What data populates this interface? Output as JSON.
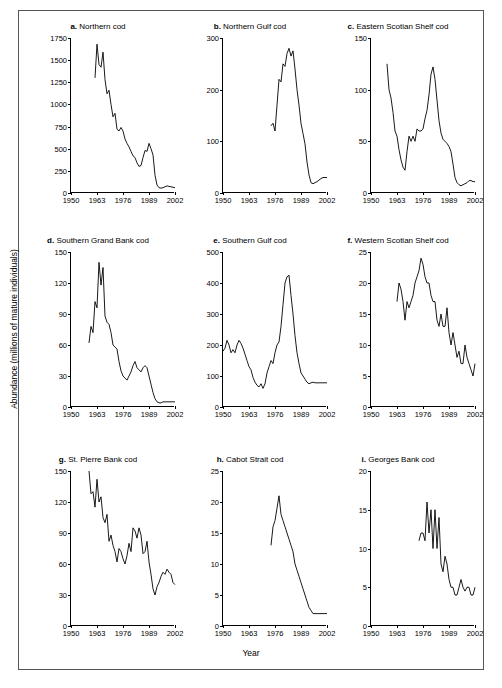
{
  "figure": {
    "ylabel": "Abundance (millions of mature individuals)",
    "xlabel": "Year"
  },
  "chart_data": [
    {
      "type": "line",
      "panel": "a",
      "title": "Northern cod",
      "xlabel": "",
      "ylabel": "",
      "grid": false,
      "legend": null,
      "xlim": [
        1950,
        2002
      ],
      "ylim": [
        0,
        1750
      ],
      "xticks": [
        1950,
        1963,
        1976,
        1989,
        2002
      ],
      "yticks": [
        0,
        250,
        500,
        750,
        1000,
        1250,
        1500,
        1750
      ],
      "x": [
        1962,
        1963,
        1964,
        1965,
        1966,
        1967,
        1968,
        1969,
        1970,
        1971,
        1972,
        1973,
        1974,
        1975,
        1976,
        1977,
        1978,
        1979,
        1980,
        1981,
        1982,
        1983,
        1984,
        1985,
        1986,
        1987,
        1988,
        1989,
        1990,
        1991,
        1992,
        1993,
        1994,
        1995,
        1996,
        1997,
        1998,
        1999,
        2000,
        2001,
        2002
      ],
      "values": [
        1300,
        1680,
        1450,
        1420,
        1590,
        1280,
        1120,
        1160,
        1000,
        860,
        900,
        720,
        700,
        740,
        700,
        610,
        560,
        520,
        470,
        420,
        400,
        340,
        300,
        310,
        400,
        480,
        470,
        560,
        500,
        430,
        200,
        90,
        60,
        55,
        60,
        70,
        80,
        75,
        70,
        65,
        60
      ]
    },
    {
      "type": "line",
      "panel": "b",
      "title": "Northern Gulf cod",
      "xlabel": "",
      "ylabel": "",
      "grid": false,
      "legend": null,
      "xlim": [
        1950,
        2002
      ],
      "ylim": [
        0,
        300
      ],
      "xticks": [
        1950,
        1963,
        1976,
        1989,
        2002
      ],
      "yticks": [
        0,
        100,
        200,
        300
      ],
      "x": [
        1974,
        1975,
        1976,
        1977,
        1978,
        1979,
        1980,
        1981,
        1982,
        1983,
        1984,
        1985,
        1986,
        1987,
        1988,
        1989,
        1990,
        1991,
        1992,
        1993,
        1994,
        1995,
        1996,
        1997,
        1998,
        1999,
        2000,
        2001,
        2002
      ],
      "values": [
        130,
        135,
        120,
        170,
        220,
        215,
        250,
        245,
        270,
        280,
        265,
        275,
        240,
        200,
        170,
        135,
        115,
        95,
        60,
        35,
        20,
        18,
        20,
        22,
        25,
        28,
        30,
        30,
        30
      ]
    },
    {
      "type": "line",
      "panel": "c",
      "title": "Eastern Scotian Shelf cod",
      "xlabel": "",
      "ylabel": "",
      "grid": false,
      "legend": null,
      "xlim": [
        1950,
        2002
      ],
      "ylim": [
        0,
        150
      ],
      "xticks": [
        1950,
        1963,
        1976,
        1989,
        2002
      ],
      "yticks": [
        0,
        50,
        100,
        150
      ],
      "x": [
        1958,
        1959,
        1960,
        1961,
        1962,
        1963,
        1964,
        1965,
        1966,
        1967,
        1968,
        1969,
        1970,
        1971,
        1972,
        1973,
        1974,
        1975,
        1976,
        1977,
        1978,
        1979,
        1980,
        1981,
        1982,
        1983,
        1984,
        1985,
        1986,
        1987,
        1988,
        1989,
        1990,
        1991,
        1992,
        1993,
        1994,
        1995,
        1996,
        1997,
        1998,
        1999,
        2000,
        2001,
        2002
      ],
      "values": [
        125,
        100,
        92,
        78,
        60,
        55,
        42,
        32,
        25,
        22,
        40,
        55,
        50,
        55,
        50,
        62,
        60,
        60,
        62,
        72,
        80,
        95,
        115,
        122,
        110,
        90,
        70,
        58,
        52,
        50,
        48,
        45,
        40,
        28,
        15,
        10,
        8,
        7,
        8,
        9,
        10,
        12,
        12,
        11,
        11
      ]
    },
    {
      "type": "line",
      "panel": "d",
      "title": "Southern Grand Bank cod",
      "xlabel": "",
      "ylabel": "",
      "grid": false,
      "legend": null,
      "xlim": [
        1950,
        2002
      ],
      "ylim": [
        0,
        150
      ],
      "xticks": [
        1950,
        1963,
        1976,
        1989,
        2002
      ],
      "yticks": [
        0,
        30,
        60,
        90,
        120,
        150
      ],
      "x": [
        1959,
        1960,
        1961,
        1962,
        1963,
        1964,
        1965,
        1966,
        1967,
        1968,
        1969,
        1970,
        1971,
        1972,
        1973,
        1974,
        1975,
        1976,
        1977,
        1978,
        1979,
        1980,
        1981,
        1982,
        1983,
        1984,
        1985,
        1986,
        1987,
        1988,
        1989,
        1990,
        1991,
        1992,
        1993,
        1994,
        1995,
        1996,
        1997,
        1998,
        1999,
        2000,
        2001,
        2002
      ],
      "values": [
        62,
        78,
        72,
        102,
        96,
        140,
        118,
        135,
        88,
        82,
        80,
        72,
        60,
        58,
        56,
        44,
        35,
        30,
        28,
        26,
        30,
        34,
        40,
        44,
        38,
        36,
        34,
        38,
        40,
        38,
        30,
        22,
        14,
        8,
        5,
        4,
        4,
        5,
        5,
        5,
        5,
        5,
        5,
        5
      ]
    },
    {
      "type": "line",
      "panel": "e",
      "title": "Southern Gulf cod",
      "xlabel": "",
      "ylabel": "",
      "grid": false,
      "legend": null,
      "xlim": [
        1950,
        2002
      ],
      "ylim": [
        0,
        500
      ],
      "xticks": [
        1950,
        1963,
        1976,
        1989,
        2002
      ],
      "yticks": [
        0,
        100,
        200,
        300,
        400,
        500
      ],
      "x": [
        1950,
        1951,
        1952,
        1953,
        1954,
        1955,
        1956,
        1957,
        1958,
        1959,
        1960,
        1961,
        1962,
        1963,
        1964,
        1965,
        1966,
        1967,
        1968,
        1969,
        1970,
        1971,
        1972,
        1973,
        1974,
        1975,
        1976,
        1977,
        1978,
        1979,
        1980,
        1981,
        1982,
        1983,
        1984,
        1985,
        1986,
        1987,
        1988,
        1989,
        1990,
        1991,
        1992,
        1993,
        1994,
        1995,
        1996,
        1997,
        1998,
        1999,
        2000,
        2001,
        2002
      ],
      "values": [
        180,
        190,
        215,
        200,
        175,
        185,
        175,
        200,
        215,
        205,
        190,
        170,
        150,
        130,
        120,
        95,
        80,
        70,
        65,
        75,
        60,
        75,
        110,
        130,
        150,
        140,
        175,
        200,
        210,
        260,
        330,
        400,
        420,
        425,
        360,
        300,
        230,
        175,
        140,
        110,
        100,
        90,
        80,
        75,
        78,
        80,
        78,
        78,
        78,
        78,
        78,
        78,
        78
      ]
    },
    {
      "type": "line",
      "panel": "f",
      "title": "Western Scotian Shelf cod",
      "xlabel": "",
      "ylabel": "",
      "grid": false,
      "legend": null,
      "xlim": [
        1950,
        2002
      ],
      "ylim": [
        0,
        25
      ],
      "xticks": [
        1950,
        1963,
        1976,
        1989,
        2002
      ],
      "yticks": [
        0,
        5,
        10,
        15,
        20,
        25
      ],
      "x": [
        1963,
        1964,
        1965,
        1966,
        1967,
        1968,
        1969,
        1970,
        1971,
        1972,
        1973,
        1974,
        1975,
        1976,
        1977,
        1978,
        1979,
        1980,
        1981,
        1982,
        1983,
        1984,
        1985,
        1986,
        1987,
        1988,
        1989,
        1990,
        1991,
        1992,
        1993,
        1994,
        1995,
        1996,
        1997,
        1998,
        1999,
        2000,
        2001,
        2002
      ],
      "values": [
        17,
        20,
        19,
        17,
        14,
        17,
        16,
        17,
        18,
        20,
        21,
        22,
        24,
        23,
        21,
        20,
        20,
        18,
        17,
        17,
        14,
        13,
        15,
        13,
        13,
        16,
        12,
        10,
        12,
        10,
        8,
        9,
        7,
        7,
        10,
        8,
        7,
        6,
        5,
        7
      ]
    },
    {
      "type": "line",
      "panel": "g",
      "title": "St. Pierre Bank cod",
      "xlabel": "",
      "ylabel": "",
      "grid": false,
      "legend": null,
      "xlim": [
        1950,
        2002
      ],
      "ylim": [
        0,
        150
      ],
      "xticks": [
        1950,
        1963,
        1976,
        1989,
        2002
      ],
      "yticks": [
        0,
        30,
        60,
        90,
        120,
        150
      ],
      "x": [
        1959,
        1960,
        1961,
        1962,
        1963,
        1964,
        1965,
        1966,
        1967,
        1968,
        1969,
        1970,
        1971,
        1972,
        1973,
        1974,
        1975,
        1976,
        1977,
        1978,
        1979,
        1980,
        1981,
        1982,
        1983,
        1984,
        1985,
        1986,
        1987,
        1988,
        1989,
        1990,
        1991,
        1992,
        1993,
        1994,
        1995,
        1996,
        1997,
        1998,
        1999,
        2000,
        2001,
        2002
      ],
      "values": [
        150,
        128,
        130,
        115,
        142,
        120,
        125,
        105,
        100,
        108,
        82,
        88,
        78,
        72,
        62,
        75,
        72,
        65,
        60,
        68,
        80,
        72,
        95,
        92,
        85,
        95,
        88,
        70,
        72,
        82,
        62,
        50,
        36,
        30,
        38,
        42,
        48,
        52,
        50,
        55,
        52,
        50,
        42,
        40
      ]
    },
    {
      "type": "line",
      "panel": "h",
      "title": "Cabot Strait cod",
      "xlabel": "",
      "ylabel": "",
      "grid": false,
      "legend": null,
      "xlim": [
        1950,
        2002
      ],
      "ylim": [
        0,
        25
      ],
      "xticks": [
        1950,
        1963,
        1976,
        1989,
        2002
      ],
      "yticks": [
        0,
        5,
        10,
        15,
        20,
        25
      ],
      "x": [
        1974,
        1975,
        1976,
        1977,
        1978,
        1979,
        1980,
        1981,
        1982,
        1983,
        1984,
        1985,
        1986,
        1987,
        1988,
        1989,
        1990,
        1991,
        1992,
        1993,
        1994,
        1995,
        1996,
        1997,
        1998,
        1999,
        2000,
        2001,
        2002
      ],
      "values": [
        13,
        16,
        17,
        19,
        21,
        18,
        17,
        16,
        15,
        14,
        13,
        12,
        10,
        9,
        8,
        7,
        6,
        5,
        4,
        3,
        2.5,
        2,
        2,
        2,
        2,
        2,
        2,
        2,
        2
      ]
    },
    {
      "type": "line",
      "panel": "i",
      "title": "Georges Bank cod",
      "xlabel": "",
      "ylabel": "",
      "grid": false,
      "legend": null,
      "xlim": [
        1950,
        2002
      ],
      "ylim": [
        0,
        20
      ],
      "xticks": [
        1950,
        1963,
        1976,
        1989,
        2002
      ],
      "yticks": [
        0,
        5,
        10,
        15,
        20
      ],
      "x": [
        1974,
        1975,
        1976,
        1977,
        1978,
        1979,
        1980,
        1981,
        1982,
        1983,
        1984,
        1985,
        1986,
        1987,
        1988,
        1989,
        1990,
        1991,
        1992,
        1993,
        1994,
        1995,
        1996,
        1997,
        1998,
        1999,
        2000,
        2001,
        2002
      ],
      "values": [
        11,
        12,
        12,
        11,
        16,
        12,
        15,
        10,
        15,
        10,
        14,
        8,
        7,
        9,
        8,
        6,
        5,
        5,
        4,
        4,
        5,
        6,
        5,
        4.5,
        5,
        5,
        4,
        4,
        5
      ]
    }
  ]
}
